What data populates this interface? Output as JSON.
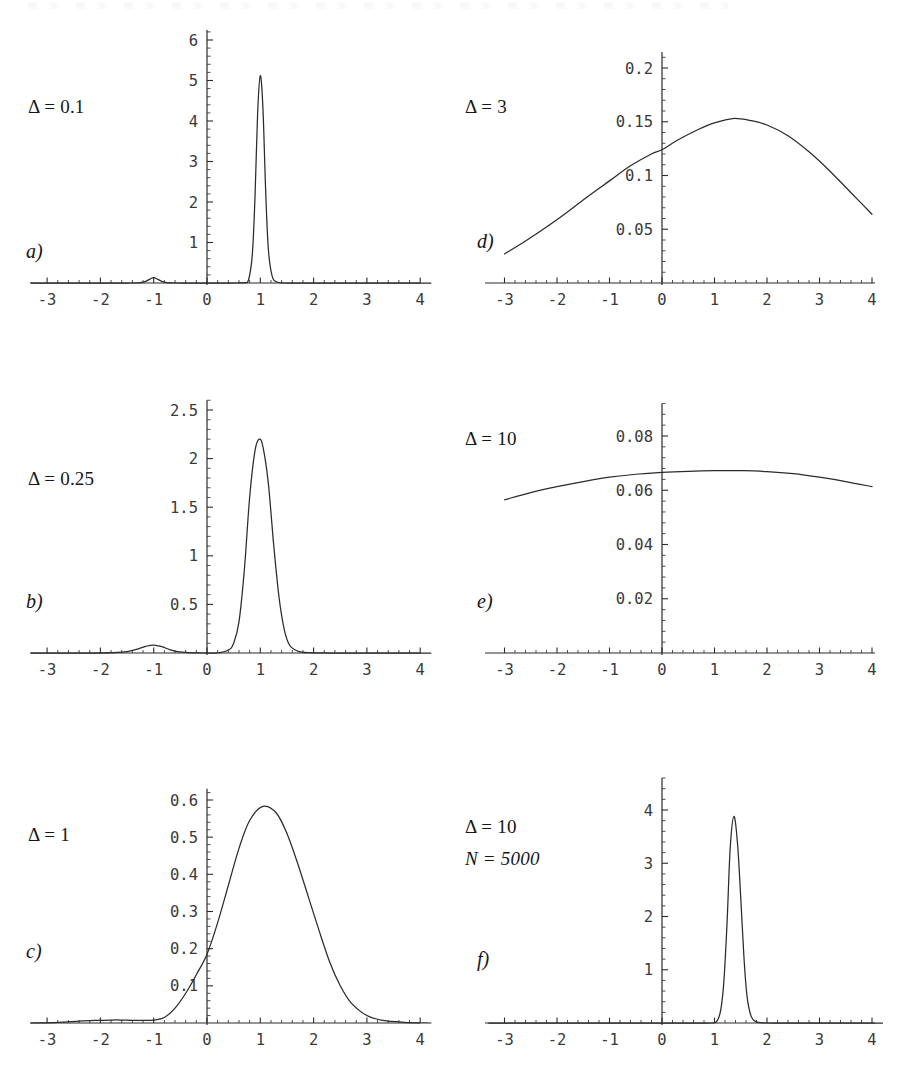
{
  "figure": {
    "background_color": "#ffffff",
    "curve_color": "#2b2b2b",
    "axis_color": "#2b2b2b",
    "panel_count": 6
  },
  "panels": [
    {
      "letter": "a)",
      "param_delta": "Δ = 0.1",
      "param_n": null,
      "x_ticks": [
        "-3",
        "-2",
        "-1",
        "0",
        "1",
        "2",
        "3",
        "4"
      ],
      "y_ticks": [
        "1",
        "2",
        "3",
        "4",
        "5",
        "6"
      ]
    },
    {
      "letter": "b)",
      "param_delta": "Δ = 0.25",
      "param_n": null,
      "x_ticks": [
        "-3",
        "-2",
        "-1",
        "0",
        "1",
        "2",
        "3",
        "4"
      ],
      "y_ticks": [
        "0.5",
        "1",
        "1.5",
        "2",
        "2.5"
      ]
    },
    {
      "letter": "c)",
      "param_delta": "Δ = 1",
      "param_n": null,
      "x_ticks": [
        "-3",
        "-2",
        "-1",
        "0",
        "1",
        "2",
        "3",
        "4"
      ],
      "y_ticks": [
        "0.1",
        "0.2",
        "0.3",
        "0.4",
        "0.5",
        "0.6"
      ]
    },
    {
      "letter": "d)",
      "param_delta": "Δ = 3",
      "param_n": null,
      "x_ticks": [
        "-3",
        "-2",
        "-1",
        "0",
        "1",
        "2",
        "3",
        "4"
      ],
      "y_ticks": [
        "0.05",
        "0.1",
        "0.15",
        "0.2"
      ]
    },
    {
      "letter": "e)",
      "param_delta": "Δ = 10",
      "param_n": null,
      "x_ticks": [
        "-3",
        "-2",
        "-1",
        "0",
        "1",
        "2",
        "3",
        "4"
      ],
      "y_ticks": [
        "0.02",
        "0.04",
        "0.06",
        "0.08"
      ]
    },
    {
      "letter": "f)",
      "param_delta": "Δ = 10",
      "param_n": "N = 5000",
      "x_ticks": [
        "-3",
        "-2",
        "-1",
        "0",
        "1",
        "2",
        "3",
        "4"
      ],
      "y_ticks": [
        "1",
        "2",
        "3",
        "4"
      ]
    }
  ],
  "chart_data": [
    {
      "id": "panel-a",
      "type": "line",
      "title": "",
      "xlabel": "",
      "ylabel": "",
      "annotation": "Δ = 0.1",
      "panel_letter": "a)",
      "xlim": [
        -3.35,
        4.25
      ],
      "ylim": [
        0,
        6.25
      ],
      "xticks": [
        -3,
        -2,
        -1,
        0,
        1,
        2,
        3,
        4
      ],
      "yticks": [
        1,
        2,
        3,
        4,
        5,
        6
      ],
      "grid": false,
      "legend": "none",
      "peaks": [
        {
          "x": 1.0,
          "y": 5.12,
          "width": 0.078,
          "weight": "main"
        },
        {
          "x": -1.0,
          "y": 0.13,
          "width": 0.085,
          "weight": "secondary"
        }
      ],
      "x": [
        -3.3,
        -2.0,
        -1.45,
        -1.25,
        -1.15,
        -1.05,
        -1.0,
        -0.95,
        -0.85,
        -0.75,
        -0.55,
        -0.2,
        0.2,
        0.55,
        0.7,
        0.78,
        0.85,
        0.9,
        0.95,
        1.0,
        1.05,
        1.1,
        1.15,
        1.22,
        1.3,
        1.45,
        1.7,
        2.2,
        3.0,
        4.2
      ],
      "y": [
        0.0,
        0.0,
        0.0,
        0.01,
        0.04,
        0.11,
        0.13,
        0.11,
        0.04,
        0.01,
        0.0,
        0.0,
        0.0,
        0.0,
        0.01,
        0.08,
        0.7,
        2.1,
        4.2,
        5.12,
        4.3,
        2.3,
        0.85,
        0.18,
        0.03,
        0.0,
        0.0,
        0.0,
        0.0,
        0.0
      ]
    },
    {
      "id": "panel-b",
      "type": "line",
      "title": "",
      "xlabel": "",
      "ylabel": "",
      "annotation": "Δ = 0.25",
      "panel_letter": "b)",
      "xlim": [
        -3.35,
        4.25
      ],
      "ylim": [
        0,
        2.6
      ],
      "xticks": [
        -3,
        -2,
        -1,
        0,
        1,
        2,
        3,
        4
      ],
      "yticks": [
        0.5,
        1,
        1.5,
        2,
        2.5
      ],
      "grid": false,
      "legend": "none",
      "peaks": [
        {
          "x": 0.98,
          "y": 2.2,
          "width": 0.21,
          "weight": "main"
        },
        {
          "x": -1.0,
          "y": 0.082,
          "width": 0.22,
          "weight": "secondary"
        }
      ],
      "x": [
        -3.3,
        -2.2,
        -1.75,
        -1.5,
        -1.3,
        -1.15,
        -1.0,
        -0.85,
        -0.7,
        -0.55,
        -0.35,
        -0.1,
        0.2,
        0.4,
        0.5,
        0.6,
        0.7,
        0.8,
        0.9,
        0.98,
        1.05,
        1.15,
        1.25,
        1.35,
        1.45,
        1.55,
        1.7,
        1.9,
        2.3,
        3.0,
        4.2
      ],
      "y": [
        0.0,
        0.0,
        0.005,
        0.015,
        0.04,
        0.068,
        0.082,
        0.065,
        0.035,
        0.013,
        0.003,
        0.0,
        0.0,
        0.03,
        0.1,
        0.32,
        0.85,
        1.6,
        2.08,
        2.2,
        2.12,
        1.75,
        1.12,
        0.58,
        0.24,
        0.08,
        0.02,
        0.003,
        0.0,
        0.0,
        0.0
      ]
    },
    {
      "id": "panel-c",
      "type": "line",
      "title": "",
      "xlabel": "",
      "ylabel": "",
      "annotation": "Δ = 1",
      "panel_letter": "c)",
      "xlim": [
        -3.35,
        4.25
      ],
      "ylim": [
        0,
        0.63
      ],
      "xticks": [
        -3,
        -2,
        -1,
        0,
        1,
        2,
        3,
        4
      ],
      "yticks": [
        0.1,
        0.2,
        0.3,
        0.4,
        0.5,
        0.6
      ],
      "grid": false,
      "legend": "none",
      "peaks": [
        {
          "x": 1.05,
          "y": 0.583,
          "width": 0.72,
          "weight": "main"
        },
        {
          "x": -1.8,
          "y": 0.008,
          "width": 0.5,
          "weight": "secondary"
        }
      ],
      "x": [
        -3.3,
        -2.8,
        -2.4,
        -2.1,
        -1.8,
        -1.6,
        -1.4,
        -1.2,
        -1.0,
        -0.8,
        -0.6,
        -0.4,
        -0.2,
        0.0,
        0.2,
        0.4,
        0.6,
        0.8,
        1.05,
        1.3,
        1.5,
        1.7,
        1.9,
        2.1,
        2.3,
        2.5,
        2.7,
        3.0,
        3.3,
        3.7,
        4.2
      ],
      "y": [
        0.0,
        0.002,
        0.005,
        0.007,
        0.008,
        0.008,
        0.007,
        0.007,
        0.008,
        0.015,
        0.04,
        0.08,
        0.13,
        0.185,
        0.27,
        0.37,
        0.47,
        0.545,
        0.583,
        0.565,
        0.51,
        0.43,
        0.34,
        0.25,
        0.165,
        0.1,
        0.055,
        0.02,
        0.007,
        0.002,
        0.0
      ]
    },
    {
      "id": "panel-d",
      "type": "line",
      "title": "",
      "xlabel": "",
      "ylabel": "",
      "annotation": "Δ = 3",
      "panel_letter": "d)",
      "xlim": [
        -3.35,
        4.25
      ],
      "ylim": [
        0,
        0.215
      ],
      "xticks": [
        -3,
        -2,
        -1,
        0,
        1,
        2,
        3,
        4
      ],
      "yticks": [
        0.05,
        0.1,
        0.15,
        0.2
      ],
      "grid": false,
      "legend": "none",
      "peaks": [
        {
          "x": 1.35,
          "y": 0.153,
          "width": 2.2,
          "weight": "main"
        }
      ],
      "x": [
        -3.0,
        -2.6,
        -2.2,
        -1.8,
        -1.4,
        -1.0,
        -0.6,
        -0.2,
        0.0,
        0.3,
        0.7,
        1.0,
        1.35,
        1.7,
        2.0,
        2.4,
        2.8,
        3.2,
        3.6,
        4.0
      ],
      "y": [
        0.027,
        0.039,
        0.052,
        0.066,
        0.081,
        0.095,
        0.109,
        0.12,
        0.124,
        0.133,
        0.143,
        0.149,
        0.153,
        0.151,
        0.147,
        0.137,
        0.122,
        0.104,
        0.084,
        0.064
      ]
    },
    {
      "id": "panel-e",
      "type": "line",
      "title": "",
      "xlabel": "",
      "ylabel": "",
      "annotation": "Δ = 10",
      "panel_letter": "e)",
      "xlim": [
        -3.35,
        4.25
      ],
      "ylim": [
        0,
        0.092
      ],
      "xticks": [
        -3,
        -2,
        -1,
        0,
        1,
        2,
        3,
        4
      ],
      "yticks": [
        0.02,
        0.04,
        0.06,
        0.08
      ],
      "grid": false,
      "legend": "none",
      "peaks": [
        {
          "x": 1.55,
          "y": 0.0672,
          "width": 6.5,
          "weight": "main"
        }
      ],
      "x": [
        -3.0,
        -2.5,
        -2.0,
        -1.5,
        -1.0,
        -0.5,
        0.0,
        0.5,
        1.0,
        1.55,
        2.0,
        2.5,
        3.0,
        3.5,
        4.0
      ],
      "y": [
        0.0565,
        0.0591,
        0.0613,
        0.0632,
        0.0648,
        0.0659,
        0.0666,
        0.067,
        0.0672,
        0.0672,
        0.0669,
        0.0661,
        0.0648,
        0.0632,
        0.0613
      ]
    },
    {
      "id": "panel-f",
      "type": "line",
      "title": "",
      "xlabel": "",
      "ylabel": "",
      "annotation": "Δ = 10, N = 5000",
      "panel_letter": "f)",
      "xlim": [
        -3.35,
        4.25
      ],
      "ylim": [
        0,
        4.6
      ],
      "xticks": [
        -3,
        -2,
        -1,
        0,
        1,
        2,
        3,
        4
      ],
      "yticks": [
        1,
        2,
        3,
        4
      ],
      "grid": false,
      "legend": "none",
      "peaks": [
        {
          "x": 1.37,
          "y": 3.88,
          "width": 0.105,
          "weight": "main"
        }
      ],
      "x": [
        -3.3,
        -1.0,
        0.5,
        0.95,
        1.05,
        1.12,
        1.18,
        1.24,
        1.3,
        1.37,
        1.44,
        1.5,
        1.56,
        1.62,
        1.7,
        1.8,
        2.0,
        2.5,
        3.2,
        4.2
      ],
      "y": [
        0.0,
        0.0,
        0.0,
        0.0,
        0.04,
        0.25,
        0.8,
        1.9,
        3.3,
        3.88,
        3.35,
        2.35,
        1.25,
        0.5,
        0.12,
        0.02,
        0.0,
        0.0,
        0.0,
        0.0
      ]
    }
  ]
}
